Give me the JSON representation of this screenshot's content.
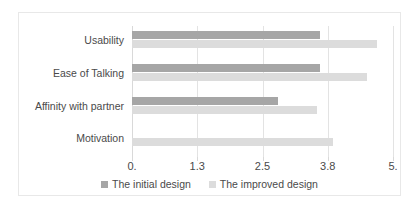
{
  "chart_data": {
    "type": "bar",
    "orientation": "horizontal",
    "title": "",
    "xlabel": "",
    "ylabel": "",
    "categories": [
      "Usability",
      "Ease of Talking",
      "Affinity with partner",
      "Motivation"
    ],
    "series": [
      {
        "name": "The initial design",
        "color": "#a6a6a6",
        "values": [
          3.6,
          3.6,
          2.8,
          0
        ]
      },
      {
        "name": "The improved design",
        "color": "#dcdcdc",
        "values": [
          4.7,
          4.5,
          3.55,
          3.85
        ]
      }
    ],
    "xlim": [
      0,
      5
    ],
    "xticks": [
      0,
      1.25,
      2.5,
      3.75,
      5
    ],
    "xtick_labels": [
      "0.",
      "1.3",
      "2.5",
      "3.8",
      "5."
    ],
    "grid": true,
    "legend_position": "bottom"
  },
  "legend": {
    "entries": [
      {
        "label": "The initial design",
        "color": "#a6a6a6"
      },
      {
        "label": "The improved design",
        "color": "#dcdcdc"
      }
    ]
  },
  "colors": {
    "initial_design": "#a6a6a6",
    "improved_design": "#dcdcdc",
    "gridline": "#e3e3e3",
    "frame_border": "#e8e8e8",
    "text": "#4a4a4a"
  }
}
